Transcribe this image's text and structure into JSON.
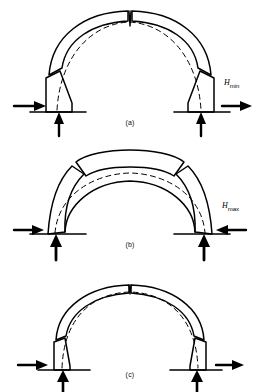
{
  "figure": {
    "background_color": "#ffffff",
    "line_color": "#000000",
    "thrust_line_style": "dashed"
  },
  "panels": [
    {
      "id": "a",
      "caption": "(a)",
      "description": "Semicircular arch ring with crown hinge notch open at extrados and hinge joints at both haunches; thrust line lies low through the ring.",
      "arch_type": "thick-ring",
      "crown_joint": "v-notch-open-at-top",
      "haunch_joints": 2,
      "thrust_line": "low-thrust",
      "reactions": {
        "left": {
          "horizontal_arrow": "right",
          "vertical_arrow": "up"
        },
        "right": {
          "horizontal_arrow": "right",
          "vertical_arrow": "up"
        }
      },
      "force_label": {
        "symbol": "H",
        "subscript": "min",
        "text": "Hmin"
      }
    },
    {
      "id": "b",
      "caption": "(b)",
      "description": "Arch with crown segment lifted and joints opening at the intrados near the haunches; thrust line rides high under the crown.",
      "arch_type": "thick-ring",
      "crown_joint": "raised-crown-block",
      "haunch_joints": 2,
      "thrust_line": "high-thrust",
      "reactions": {
        "left": {
          "horizontal_arrow": "right",
          "vertical_arrow": "up"
        },
        "right": {
          "horizontal_arrow": "left",
          "vertical_arrow": "up"
        }
      },
      "force_label": {
        "symbol": "H",
        "subscript": "max",
        "text": "Hmax"
      }
    },
    {
      "id": "c",
      "caption": "(c)",
      "description": "Slender arch ring with small crown notch and haunch joints; thrust line close to the ring axis, no horizontal force labelled.",
      "arch_type": "thin-ring",
      "crown_joint": "small-v-notch",
      "haunch_joints": 2,
      "thrust_line": "axial",
      "reactions": {
        "left": {
          "horizontal_arrow": "right",
          "vertical_arrow": "up"
        },
        "right": {
          "horizontal_arrow": "right",
          "vertical_arrow": "up"
        }
      },
      "force_label": null
    }
  ],
  "labels": {
    "h_min": "Hmin",
    "h_max": "Hmax",
    "h_symbol": "H",
    "sub_min": "min",
    "sub_max": "max"
  }
}
